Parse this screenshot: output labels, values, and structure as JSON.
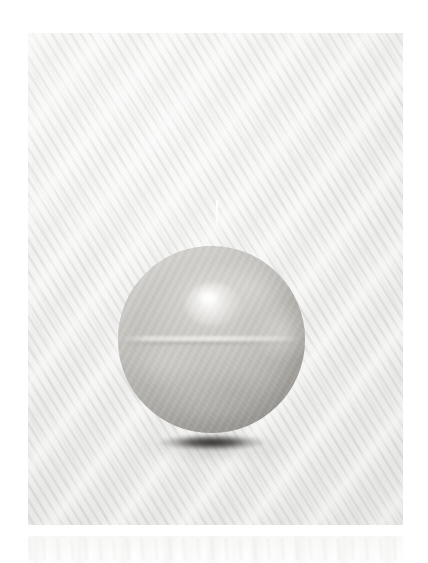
{
  "image": {
    "kind": "photograph",
    "subject": "sphere-candle",
    "caption": "Matte grey-beige spherical wax candle with a short white wick, resting on a white ribbed textile backdrop",
    "canvas": {
      "width": 428,
      "height": 563
    },
    "border_color": "#ffffff"
  },
  "backdrop": {
    "name": "white ribbed textile",
    "base_color": "#f6f6f4",
    "highlight_color": "#fbfbfa",
    "shadow_color": "#ececea",
    "weave": "diagonal wavy ribbing running lower-left to upper-right",
    "plate": {
      "x": 28,
      "y": 33,
      "width": 375,
      "height": 492
    }
  },
  "subject": {
    "name": "sphere candle",
    "material": "matte wax",
    "body_color": "#c4c2bd",
    "light_color": "#d9d7d2",
    "dark_color": "#9d9b97",
    "highlight_color": "#ffffff",
    "center": {
      "x": 211,
      "y": 339
    },
    "diameter": 187,
    "seam": "faint horizontal mould seam across the equator",
    "highlight_position": "upper-left of centre"
  },
  "wick": {
    "name": "candle wick",
    "color": "#ffffff",
    "x": 216,
    "y": 200,
    "length": 30,
    "thickness": 2.4
  },
  "shadow": {
    "name": "contact shadow",
    "color": "#1e1d1c",
    "soft_color": "#787672",
    "x": 157,
    "y": 434,
    "width": 110,
    "height": 20
  },
  "lower_band": {
    "name": "faint textile band below plate",
    "color": "#f3f3f1",
    "y": 536,
    "height": 27
  }
}
